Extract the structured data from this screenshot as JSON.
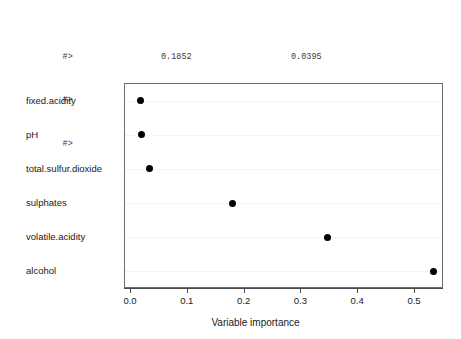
{
  "console": {
    "lines": [
      {
        "prompt": "#>",
        "col1": "0.1852",
        "col2": "0.0395"
      },
      {
        "prompt": "#>",
        "col1": "pH",
        "col2": "fixed.acidity"
      },
      {
        "prompt": "#>",
        "col1": "0.0235",
        "col2": "0.0188"
      }
    ]
  },
  "chart_data": {
    "type": "scatter",
    "title": "",
    "subtitle": "",
    "xlabel": "Variable importance",
    "ylabel": "",
    "categories": [
      "fixed.acidity",
      "pH",
      "total.sulfur.dioxide",
      "sulphates",
      "volatile.acidity",
      "alcohol"
    ],
    "values": [
      0.016,
      0.018,
      0.032,
      0.179,
      0.346,
      0.533
    ],
    "xlim": [
      -0.01,
      0.55
    ],
    "xticks": [
      0.0,
      0.1,
      0.2,
      0.3,
      0.4,
      0.5
    ],
    "xticklabels": [
      "0.0",
      "0.1",
      "0.2",
      "0.3",
      "0.4",
      "0.5"
    ],
    "grid": true,
    "grid_style": "dotted-horizontal",
    "legend": false,
    "marker": "filled-circle",
    "marker_color": "#000000",
    "frame_color": "#6e6e6e",
    "grid_color": "#ececec",
    "orientation": "horizontal"
  }
}
